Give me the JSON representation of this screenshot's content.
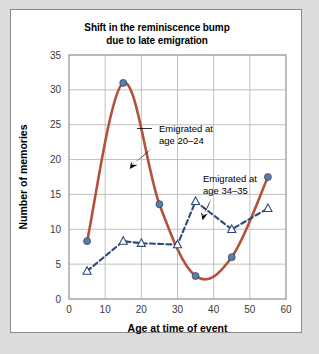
{
  "chart_data": {
    "type": "line",
    "title": "Shift in the reminiscence bump due to late emigration",
    "title_line1": "Shift in the reminiscence bump",
    "title_line2": "due to late emigration",
    "xlabel": "Age at time of event",
    "ylabel": "Number of memories",
    "xlim": [
      0,
      60
    ],
    "ylim": [
      0,
      35
    ],
    "xticks": [
      0,
      10,
      20,
      30,
      40,
      50,
      60
    ],
    "yticks": [
      0,
      5,
      10,
      15,
      20,
      25,
      30,
      35
    ],
    "grid": true,
    "legend_position": "inline-annotations",
    "series": [
      {
        "name": "Emigrated at age 20–24",
        "style": "solid",
        "marker": "circle",
        "color": "#b5503c",
        "marker_color": "#5a7ca8",
        "x": [
          5,
          15,
          25,
          35,
          45,
          55
        ],
        "values": [
          8.3,
          31.0,
          13.6,
          3.3,
          6.0,
          17.5
        ]
      },
      {
        "name": "Emigrated at age 34–35",
        "style": "dashed",
        "marker": "triangle",
        "color": "#2f4a7c",
        "marker_color": "#2f4a7c",
        "x": [
          5,
          15,
          20,
          30,
          35,
          45,
          55
        ],
        "values": [
          4.0,
          8.3,
          8.0,
          7.8,
          14.0,
          10.0,
          13.0
        ]
      }
    ],
    "annotations": [
      {
        "text": "Emigrated at age 20–24",
        "line1": "Emigrated at",
        "line2": "age 20–24",
        "target_series": "Emigrated at age 20–24"
      },
      {
        "text": "Emigrated at age 34–35",
        "line1": "Emigrated at",
        "line2": "age 34–35",
        "target_series": "Emigrated at age 34–35"
      }
    ]
  }
}
